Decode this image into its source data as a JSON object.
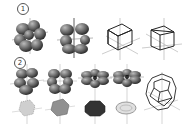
{
  "figure": {
    "rows": [
      {
        "label": "1",
        "panels": [
          {
            "id": "r1p1",
            "kind": "lobes",
            "description": "clustered grey lobes (orbital-like), tilted view"
          },
          {
            "id": "r1p2",
            "kind": "lobes",
            "description": "clustered grey lobes with axes, side view"
          },
          {
            "id": "r1p3",
            "kind": "cube-wireframe",
            "description": "wireframe cube with axes, tilted"
          },
          {
            "id": "r1p4",
            "kind": "cube-wireframe",
            "description": "wireframe cube with axes, rotated"
          }
        ]
      },
      {
        "label": "2",
        "panels": [
          {
            "id": "r2p1",
            "kind": "lobes-with-shape",
            "description": "lobes cluster above, light dotted polyhedron below"
          },
          {
            "id": "r2p2",
            "kind": "lobes-with-shape",
            "description": "lobes cluster above, grey polyhedron below"
          },
          {
            "id": "r2p3",
            "kind": "lobes-with-shape",
            "description": "flattened lobes above, dark hexagonal shape below"
          },
          {
            "id": "r2p4",
            "kind": "lobes-with-shape",
            "description": "flattened lobes above, light ellipse below"
          },
          {
            "id": "r2p5",
            "kind": "truncated-octahedron",
            "description": "wireframe truncated octahedron with axes"
          }
        ]
      }
    ],
    "colors": {
      "lobe_dark": "#3a3a3a",
      "lobe_mid": "#6a6a6a",
      "lobe_light": "#9a9a9a",
      "line": "#222222",
      "axis": "#999999",
      "background": "#ffffff"
    }
  }
}
